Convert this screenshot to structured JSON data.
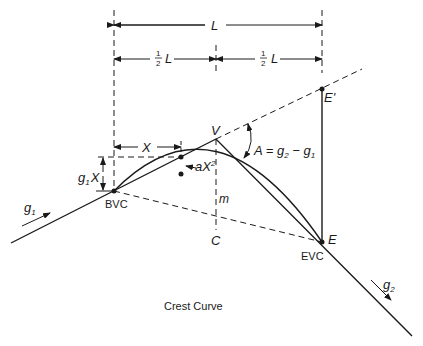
{
  "title": "Crest Curve",
  "labels": {
    "length": "L",
    "half": "1",
    "half_den": "2",
    "half_L": "L",
    "x": "X",
    "g1x": "g",
    "g1x_sub": "1",
    "g1x_x": "X",
    "ax2": "aX",
    "ax2_sup": "2",
    "V": "V",
    "m": "m",
    "C": "C",
    "BVC": "BVC",
    "EVC": "EVC",
    "E": "E",
    "E_prime": "E'",
    "A_eq": "A = g",
    "A_sub2": "2",
    "A_minus": " − g",
    "A_sub1": "1",
    "g1": "g",
    "g1_sub": "1",
    "g2": "g",
    "g2_sub": "2"
  },
  "colors": {
    "line": "#1a1a1a",
    "background": "#ffffff"
  }
}
